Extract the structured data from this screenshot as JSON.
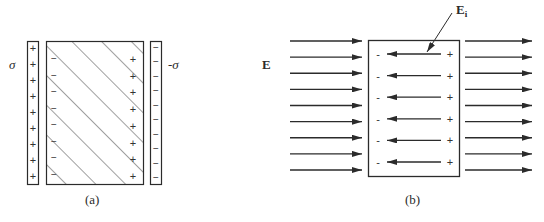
{
  "figure": {
    "panel_a": {
      "caption": "(a)",
      "left_plate_label": "σ",
      "right_plate_label": "-σ",
      "left_plate_charge": "+",
      "right_plate_charge": "−",
      "slab_left_induced_charge": "−",
      "slab_right_induced_charge": "+",
      "left_plate_charge_count": 9,
      "right_plate_charge_count": 10,
      "slab_left_charge_count": 8,
      "slab_right_charge_count": 8,
      "slab_fill": "diagonal hatching"
    },
    "panel_b": {
      "caption": "(b)",
      "external_field_label": "E",
      "internal_field_label": "E",
      "internal_field_subscript": "i",
      "external_arrow_count_left": 9,
      "external_arrow_count_right": 9,
      "internal_arrow_count": 6,
      "internal_left_charge": "-",
      "internal_right_charge": "+"
    },
    "colors": {
      "line": "#2b2b2b",
      "background": "#ffffff"
    }
  }
}
